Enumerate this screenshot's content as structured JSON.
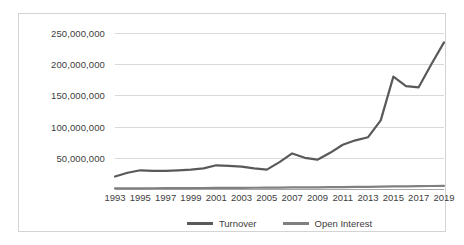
{
  "chart_data": {
    "type": "line",
    "title": "",
    "xlabel": "",
    "ylabel": "",
    "grid": true,
    "legend_position": "bottom",
    "x": [
      1993,
      1994,
      1995,
      1996,
      1997,
      1998,
      1999,
      2000,
      2001,
      2002,
      2003,
      2004,
      2005,
      2006,
      2007,
      2008,
      2009,
      2010,
      2011,
      2012,
      2013,
      2014,
      2015,
      2016,
      2017,
      2018,
      2019
    ],
    "xtick_labels": [
      "1993",
      "1995",
      "1997",
      "1999",
      "2001",
      "2003",
      "2005",
      "2007",
      "2009",
      "2011",
      "2013",
      "2015",
      "2017",
      "2019"
    ],
    "ytick_labels": [
      "50,000,000",
      "100,000,000",
      "150,000,000",
      "200,000,000",
      "250,000,000"
    ],
    "ytick_values": [
      50000000,
      100000000,
      150000000,
      200000000,
      250000000
    ],
    "ylim": [
      0,
      250000000
    ],
    "xlim": [
      1993,
      2019
    ],
    "series": [
      {
        "name": "Turnover",
        "color": "#595959",
        "values": [
          20000000,
          26000000,
          30000000,
          29000000,
          29000000,
          30000000,
          31000000,
          33000000,
          38000000,
          37000000,
          36000000,
          33000000,
          31000000,
          43000000,
          57000000,
          50000000,
          47000000,
          58000000,
          71000000,
          78000000,
          83000000,
          110000000,
          180000000,
          165000000,
          163000000,
          200000000,
          235000000
        ]
      },
      {
        "name": "Open Interest",
        "color": "#808080",
        "values": [
          900000,
          1000000,
          1100000,
          1200000,
          1300000,
          1400000,
          1500000,
          1600000,
          1700000,
          1800000,
          1900000,
          2000000,
          2100000,
          2300000,
          2500000,
          2600000,
          2700000,
          2900000,
          3100000,
          3300000,
          3500000,
          3800000,
          4100000,
          4300000,
          4500000,
          4800000,
          5000000
        ]
      }
    ]
  },
  "legend": {
    "items": [
      {
        "label": "Turnover",
        "color": "#595959"
      },
      {
        "label": "Open Interest",
        "color": "#808080"
      }
    ]
  },
  "colors": {
    "plot_border": "#d4d4d4",
    "gridline": "#d9d9d9",
    "axis_line": "#a6a6a6",
    "text": "#404040",
    "background": "#ffffff"
  }
}
